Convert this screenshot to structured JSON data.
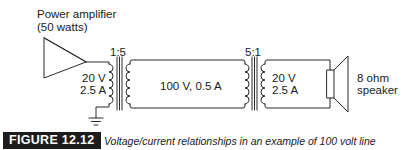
{
  "diagram": {
    "amplifier": {
      "label_line1": "Power amplifier",
      "label_line2": "(50 watts)"
    },
    "transformer_1": {
      "ratio": "1:5",
      "primary_voltage": "20 V",
      "primary_current": "2.5 A"
    },
    "line": {
      "label": "100 V, 0.5 A"
    },
    "transformer_2": {
      "ratio": "5:1",
      "secondary_voltage": "20 V",
      "secondary_current": "2.5 A"
    },
    "speaker": {
      "label_line1": "8 ohm",
      "label_line2": "speaker"
    },
    "ground": {
      "icon": "ground-icon"
    }
  },
  "caption": {
    "figure_number": "FIGURE 12.12",
    "text": "Voltage/current relationships in an example of 100 volt line operation."
  },
  "colors": {
    "line": "#2a2a2a",
    "badge_bg": "#1c1c1c",
    "badge_text": "#ffffff"
  }
}
